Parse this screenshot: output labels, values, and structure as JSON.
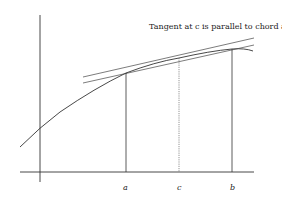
{
  "title": "Tangent at c is parallel to chord a, b",
  "labels": {
    "a": "a",
    "c": "c",
    "b": "b"
  },
  "colors": {
    "ink": "#333333",
    "dotted": "#666666"
  }
}
